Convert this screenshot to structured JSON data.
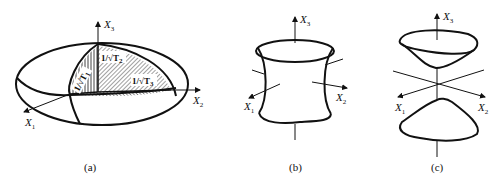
{
  "figure": {
    "panels": [
      {
        "id": "a",
        "caption": "(a)",
        "shape": "ellipsoid",
        "axes": {
          "x1": "X",
          "x1_sub": "1",
          "x2": "X",
          "x2_sub": "2",
          "x3": "X",
          "x3_sub": "3"
        },
        "semi_axis_labels": [
          {
            "text": "1/√T",
            "sub": "1"
          },
          {
            "text": "1/√T",
            "sub": "2"
          },
          {
            "text": "1/√T",
            "sub": "3"
          }
        ]
      },
      {
        "id": "b",
        "caption": "(b)",
        "shape": "hyperboloid-one-sheet",
        "axes": {
          "x1": "X",
          "x1_sub": "1",
          "x2": "X",
          "x2_sub": "2",
          "x3": "X",
          "x3_sub": "3"
        }
      },
      {
        "id": "c",
        "caption": "(c)",
        "shape": "hyperboloid-two-sheets",
        "axes": {
          "x1": "X",
          "x1_sub": "1",
          "x2": "X",
          "x2_sub": "2",
          "x3": "X",
          "x3_sub": "3"
        }
      }
    ],
    "colors": {
      "stroke": "#111111",
      "background": "#ffffff"
    }
  }
}
